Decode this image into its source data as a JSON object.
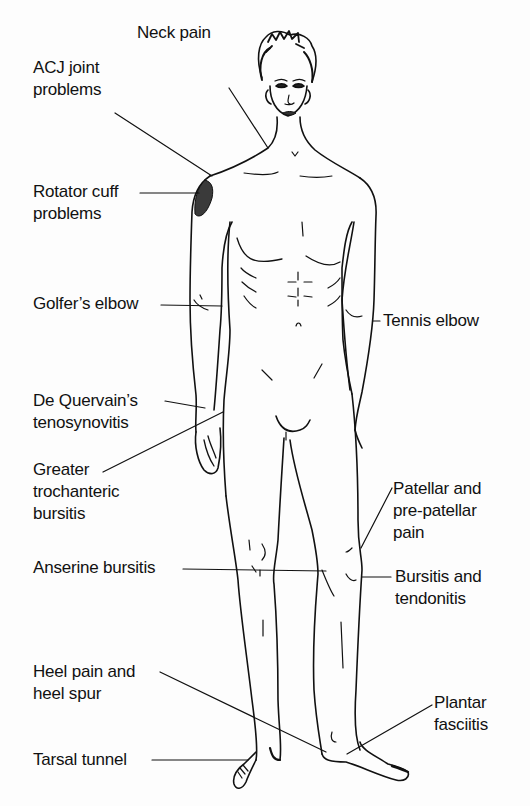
{
  "diagram": {
    "type": "anatomical-annotation",
    "colors": {
      "line": "#111111",
      "background": "#ffffff",
      "highlight": "#3a3a3a"
    },
    "labels": [
      {
        "id": "neck-pain",
        "lines": [
          "Neck pain"
        ],
        "side": "left"
      },
      {
        "id": "acj-joint",
        "lines": [
          "ACJ joint",
          "problems"
        ],
        "side": "left"
      },
      {
        "id": "rotator-cuff",
        "lines": [
          "Rotator cuff",
          "problems"
        ],
        "side": "left"
      },
      {
        "id": "golfers-elbow",
        "lines": [
          "Golfer’s elbow"
        ],
        "side": "left"
      },
      {
        "id": "tennis-elbow",
        "lines": [
          "Tennis elbow"
        ],
        "side": "right"
      },
      {
        "id": "de-quervain",
        "lines": [
          "De Quervain’s",
          "tenosynovitis"
        ],
        "side": "left"
      },
      {
        "id": "greater-trochanteric",
        "lines": [
          "Greater",
          "trochanteric",
          "bursitis"
        ],
        "side": "left"
      },
      {
        "id": "patellar",
        "lines": [
          "Patellar and",
          "pre-patellar",
          "pain"
        ],
        "side": "right"
      },
      {
        "id": "anserine",
        "lines": [
          "Anserine bursitis"
        ],
        "side": "left"
      },
      {
        "id": "bursitis-tendonitis",
        "lines": [
          "Bursitis and",
          "tendonitis"
        ],
        "side": "right"
      },
      {
        "id": "heel-pain",
        "lines": [
          "Heel pain and",
          "heel spur"
        ],
        "side": "left"
      },
      {
        "id": "plantar",
        "lines": [
          "Plantar",
          "fasciitis"
        ],
        "side": "right"
      },
      {
        "id": "tarsal",
        "lines": [
          "Tarsal tunnel"
        ],
        "side": "left"
      }
    ]
  }
}
